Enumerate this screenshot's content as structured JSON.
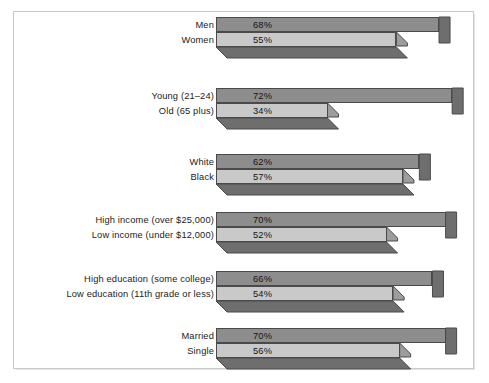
{
  "chart_data": {
    "type": "bar",
    "orientation": "horizontal",
    "title": "",
    "subtitle": "",
    "xlabel": "",
    "ylabel": "",
    "xlim": [
      0,
      80
    ],
    "grid": false,
    "legend": "none",
    "value_suffix": "%",
    "groups": [
      {
        "name": "gender",
        "bars": [
          {
            "label": "Men",
            "value": 68,
            "value_label": "68%",
            "shade": "dark"
          },
          {
            "label": "Women",
            "value": 55,
            "value_label": "55%",
            "shade": "light"
          }
        ]
      },
      {
        "name": "age",
        "bars": [
          {
            "label": "Young (21–24)",
            "value": 72,
            "value_label": "72%",
            "shade": "dark"
          },
          {
            "label": "Old (65 plus)",
            "value": 34,
            "value_label": "34%",
            "shade": "light"
          }
        ]
      },
      {
        "name": "race",
        "bars": [
          {
            "label": "White",
            "value": 62,
            "value_label": "62%",
            "shade": "dark"
          },
          {
            "label": "Black",
            "value": 57,
            "value_label": "57%",
            "shade": "light"
          }
        ]
      },
      {
        "name": "income",
        "bars": [
          {
            "label": "High income (over $25,000)",
            "value": 70,
            "value_label": "70%",
            "shade": "dark"
          },
          {
            "label": "Low income (under $12,000)",
            "value": 52,
            "value_label": "52%",
            "shade": "light"
          }
        ]
      },
      {
        "name": "education",
        "bars": [
          {
            "label": "High education (some college)",
            "value": 66,
            "value_label": "66%",
            "shade": "dark"
          },
          {
            "label": "Low education (11th grade or less)",
            "value": 54,
            "value_label": "54%",
            "shade": "light"
          }
        ]
      },
      {
        "name": "marital-status",
        "bars": [
          {
            "label": "Married",
            "value": 70,
            "value_label": "70%",
            "shade": "dark"
          },
          {
            "label": "Single",
            "value": 56,
            "value_label": "56%",
            "shade": "light"
          }
        ]
      }
    ],
    "categories": [
      "Men",
      "Women",
      "Young (21–24)",
      "Old (65 plus)",
      "White",
      "Black",
      "High income (over $25,000)",
      "Low income (under $12,000)",
      "High education (some college)",
      "Low education (11th grade or less)",
      "Married",
      "Single"
    ],
    "values": [
      68,
      55,
      72,
      34,
      62,
      57,
      70,
      52,
      66,
      54,
      70,
      56
    ]
  },
  "colors": {
    "bar_dark": "#8d8d8d",
    "bar_light": "#c9c9c9",
    "bar_outline": "#4a4a4a",
    "side_dark": "#6e6e6e",
    "side_light": "#9d9d9d",
    "frame_border": "#c9c9c9",
    "background": "#ffffff",
    "text": "#141414"
  },
  "layout": {
    "bar_origin_x": 216,
    "px_per_percent": 3.28,
    "bar_height": 15,
    "depth_x": 11,
    "depth_y": 11,
    "group_tops": [
      17,
      88,
      154,
      212,
      271,
      328
    ]
  }
}
